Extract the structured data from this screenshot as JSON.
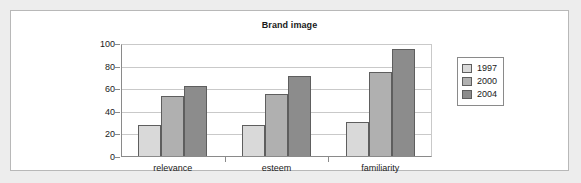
{
  "chart_data": {
    "type": "bar",
    "title": "Brand image",
    "xlabel": "",
    "ylabel": "",
    "categories": [
      "relevance",
      "esteem",
      "familiarity"
    ],
    "series": [
      {
        "name": "1997",
        "color": "#d9d9d9",
        "values": [
          28,
          28,
          31
        ]
      },
      {
        "name": "2000",
        "color": "#b0b0b0",
        "values": [
          54,
          56,
          75
        ]
      },
      {
        "name": "2004",
        "color": "#8c8c8c",
        "values": [
          63,
          72,
          96
        ]
      }
    ],
    "ylim": [
      0,
      100
    ],
    "yticks": [
      0,
      20,
      40,
      60,
      80,
      100
    ],
    "grid": true,
    "legend_position": "right"
  },
  "legend": {
    "entries": [
      {
        "label": "1997"
      },
      {
        "label": "2000"
      },
      {
        "label": "2004"
      }
    ]
  }
}
